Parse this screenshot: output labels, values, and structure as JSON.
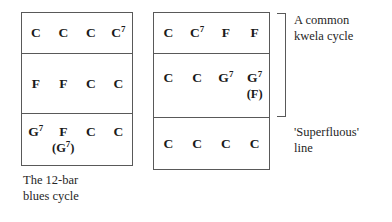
{
  "figure": {
    "type": "chord-cycle-diagram",
    "background_color": "#ffffff",
    "line_color": "#595959",
    "text_color": "#1a1a1a"
  },
  "boxes": [
    {
      "id": "blues",
      "name": "twelve-bar-blues-grid",
      "caption": "The 12-bar\nblues cycle",
      "rows": [
        {
          "main": [
            "C",
            "C",
            "C",
            "C⁷"
          ],
          "alt": [
            "",
            "",
            "",
            ""
          ]
        },
        {
          "main": [
            "F",
            "F",
            "C",
            "C"
          ],
          "alt": [
            "",
            "",
            "",
            ""
          ]
        },
        {
          "main": [
            "G⁷",
            "F",
            "C",
            "C"
          ],
          "alt": [
            "",
            "(G⁷)",
            "",
            ""
          ]
        }
      ]
    },
    {
      "id": "kwela",
      "name": "kwela-cycle-grid",
      "caption": "",
      "rows": [
        {
          "main": [
            "C",
            "C⁷",
            "F",
            "F"
          ],
          "alt": [
            "",
            "",
            "",
            ""
          ]
        },
        {
          "main": [
            "C",
            "C",
            "G⁷",
            "G⁷"
          ],
          "alt": [
            "",
            "",
            "",
            "(F)"
          ]
        },
        {
          "main": [
            "C",
            "C",
            "C",
            "C"
          ],
          "alt": [
            "",
            "",
            "",
            ""
          ]
        }
      ]
    }
  ],
  "annotations": {
    "bracket_label": "A common\nkwela cycle",
    "superfluous_label": "'Superfluous'\nline"
  }
}
